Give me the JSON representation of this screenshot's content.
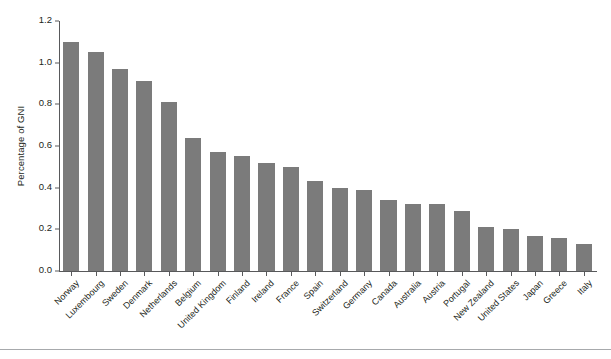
{
  "chart_data": {
    "type": "bar",
    "title": "",
    "xlabel": "",
    "ylabel": "Percentage of GNI",
    "ylim": [
      0.0,
      1.2
    ],
    "ytick_labels": [
      "0.0",
      "0.2",
      "0.4",
      "0.6",
      "0.8",
      "1.0",
      "1.2"
    ],
    "ytick_values": [
      0.0,
      0.2,
      0.4,
      0.6,
      0.8,
      1.0,
      1.2
    ],
    "grid": false,
    "legend": null,
    "bar_color": "#7b7b7b",
    "axis_color": "#58595b",
    "categories": [
      "Norway",
      "Luxembourg",
      "Sweden",
      "Denmark",
      "Netherlands",
      "Belgium",
      "United Kingdom",
      "Finland",
      "Ireland",
      "France",
      "Spain",
      "Switzerland",
      "Germany",
      "Canada",
      "Australia",
      "Austria",
      "Portugal",
      "New Zealand",
      "United States",
      "Japan",
      "Greece",
      "Italy"
    ],
    "values": [
      1.1,
      1.05,
      0.97,
      0.91,
      0.81,
      0.64,
      0.57,
      0.55,
      0.52,
      0.5,
      0.43,
      0.4,
      0.39,
      0.34,
      0.32,
      0.32,
      0.29,
      0.21,
      0.2,
      0.17,
      0.16,
      0.13
    ]
  }
}
